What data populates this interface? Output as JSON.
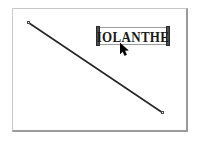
{
  "app": {
    "surface_name": "drawing-canvas",
    "background_color": "#ffffff",
    "frame_color": "#9a9a9a"
  },
  "canvas": {
    "frame": {
      "x": 12,
      "y": 8,
      "width": 176,
      "height": 124
    }
  },
  "objects": {
    "line": {
      "name": "diagonal-line",
      "selected": true,
      "color": "#262626",
      "stroke_width": 1.6,
      "start": {
        "x": 29,
        "y": 23
      },
      "end": {
        "x": 163,
        "y": 113
      },
      "handles": [
        {
          "x": 27,
          "y": 21
        },
        {
          "x": 161,
          "y": 111
        }
      ]
    },
    "text": {
      "name": "text-object-iolanthe",
      "content": "IOLANTHE",
      "selected": true,
      "color": "#1a1a1a",
      "box": {
        "x": 97,
        "y": 27,
        "width": 72,
        "height": 18
      },
      "handle_color": "#4d4d4d"
    }
  },
  "cursor": {
    "name": "arrow-cursor",
    "type": "arrow",
    "color": "#000000",
    "x": 120,
    "y": 43
  }
}
